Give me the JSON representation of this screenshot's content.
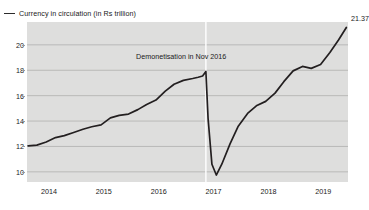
{
  "legend": {
    "marker": "line-swatch-icon",
    "label": "Currency in circulation (in Rs trillion)"
  },
  "annotation": {
    "text": "Demonetisation in Nov 2016"
  },
  "end_label": {
    "value": "21.37"
  },
  "colors": {
    "line": "#231f20",
    "plot_background": "#dededd",
    "gridline": "#b0b0ae",
    "event_marker": "#ffffff",
    "text": "#1a1a1a"
  },
  "axes": {
    "y_ticks": [
      "10",
      "12",
      "14",
      "16",
      "18",
      "20"
    ],
    "x_ticks": [
      "2014",
      "2015",
      "2016",
      "2017",
      "2018",
      "2019"
    ]
  },
  "chart_data": {
    "type": "line",
    "title": "",
    "subtitle": "",
    "xlabel": "",
    "ylabel": "",
    "ylim": [
      9.2,
      21.8
    ],
    "xlim": [
      2013.6,
      2019.45
    ],
    "grid": true,
    "legend_position": "top-left",
    "y_ticks": [
      10,
      12,
      14,
      16,
      18,
      20
    ],
    "x_ticks": [
      2014,
      2015,
      2016,
      2017,
      2018,
      2019
    ],
    "annotations": [
      {
        "text": "Demonetisation in Nov 2016",
        "x": 2016.86,
        "type": "vertical-line-label"
      }
    ],
    "event_marker_x": 2016.86,
    "data_labels": [
      {
        "x": 2019.42,
        "y": 21.37,
        "text": "21.37"
      }
    ],
    "series": [
      {
        "name": "Currency in circulation (in Rs trillion)",
        "x": [
          2013.62,
          2013.78,
          2013.95,
          2014.12,
          2014.28,
          2014.45,
          2014.62,
          2014.78,
          2014.95,
          2015.12,
          2015.28,
          2015.45,
          2015.62,
          2015.78,
          2015.95,
          2016.12,
          2016.28,
          2016.45,
          2016.62,
          2016.72,
          2016.8,
          2016.86,
          2016.9,
          2016.97,
          2017.05,
          2017.15,
          2017.3,
          2017.45,
          2017.62,
          2017.78,
          2017.95,
          2018.12,
          2018.28,
          2018.45,
          2018.62,
          2018.78,
          2018.95,
          2019.12,
          2019.28,
          2019.42
        ],
        "y": [
          12.05,
          12.1,
          12.35,
          12.7,
          12.85,
          13.1,
          13.35,
          13.55,
          13.7,
          14.25,
          14.45,
          14.55,
          14.9,
          15.3,
          15.65,
          16.35,
          16.9,
          17.2,
          17.35,
          17.45,
          17.55,
          17.9,
          14.2,
          10.6,
          9.75,
          10.6,
          12.2,
          13.6,
          14.6,
          15.2,
          15.55,
          16.2,
          17.1,
          17.95,
          18.3,
          18.15,
          18.45,
          19.4,
          20.4,
          21.37
        ]
      }
    ]
  }
}
